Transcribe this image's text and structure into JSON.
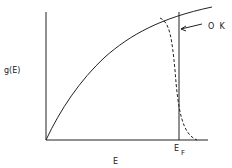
{
  "diagram": {
    "type": "density_of_states_fermi",
    "y_axis_label": "g(E)",
    "x_axis_label": "E",
    "fermi_label_main": "E",
    "fermi_label_sub": "F",
    "annotation_label": "O  K",
    "colors": {
      "line": "#222222",
      "background": "#ffffff"
    }
  }
}
